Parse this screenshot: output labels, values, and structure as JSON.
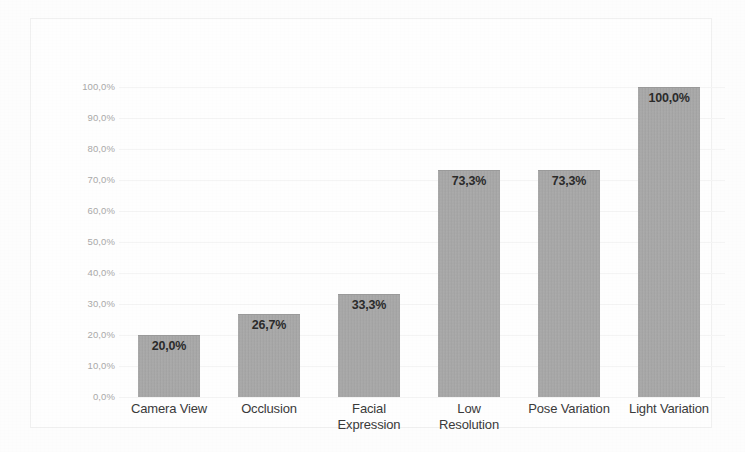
{
  "chart_data": {
    "type": "bar",
    "title": "",
    "subtitle": "",
    "xlabel": "",
    "ylabel": "",
    "ylim": [
      0,
      100
    ],
    "y_unit": "%",
    "decimal_separator": ",",
    "grid": true,
    "legend": "none",
    "orientation": "vertical",
    "categories": [
      "Camera View",
      "Occlusion",
      "Facial Expression",
      "Low Resolution",
      "Pose Variation",
      "Light Variation"
    ],
    "category_lines": [
      [
        "Camera View"
      ],
      [
        "Occlusion"
      ],
      [
        "Facial",
        "Expression"
      ],
      [
        "Low",
        "Resolution"
      ],
      [
        "Pose Variation"
      ],
      [
        "Light Variation"
      ]
    ],
    "values": [
      20.0,
      26.7,
      33.3,
      73.3,
      73.3,
      100.0
    ],
    "data_labels": [
      "20,0%",
      "26,7%",
      "33,3%",
      "73,3%",
      "73,3%",
      "100,0%"
    ],
    "y_ticks": [
      0,
      10,
      20,
      30,
      40,
      50,
      60,
      70,
      80,
      90,
      100
    ],
    "y_tick_labels": [
      "0,0%",
      "10,0%",
      "20,0%",
      "30,0%",
      "40,0%",
      "50,0%",
      "60,0%",
      "70,0%",
      "80,0%",
      "90,0%",
      "100,0%"
    ],
    "colors": {
      "bar_fill": "#a9a9a9",
      "bar_edge": "#9a9a9a",
      "gridline": "#f4f4f4",
      "axis_text": "#a9a9a9",
      "category_text": "#3a3a3a",
      "data_label_text": "#2b2b2b",
      "plot_background": "#fefefe",
      "frame_border": "#f0f0f0"
    }
  }
}
